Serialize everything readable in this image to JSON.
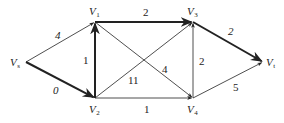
{
  "diagram": {
    "type": "directed-network",
    "nodes": [
      {
        "id": "Vs",
        "label": "V",
        "sub": "s",
        "x": 26,
        "y": 62,
        "lx": 10,
        "ly": 66
      },
      {
        "id": "V1",
        "label": "V",
        "sub": "1",
        "x": 95,
        "y": 22,
        "lx": 89,
        "ly": 15
      },
      {
        "id": "V2",
        "label": "V",
        "sub": "2",
        "x": 95,
        "y": 98,
        "lx": 89,
        "ly": 113
      },
      {
        "id": "V3",
        "label": "V",
        "sub": "3",
        "x": 193,
        "y": 22,
        "lx": 187,
        "ly": 15
      },
      {
        "id": "V4",
        "label": "V",
        "sub": "4",
        "x": 193,
        "y": 98,
        "lx": 187,
        "ly": 113
      },
      {
        "id": "Vt",
        "label": "V",
        "sub": "t",
        "x": 263,
        "y": 62,
        "lx": 266,
        "ly": 66
      }
    ],
    "edges": [
      {
        "from": "Vs",
        "to": "V1",
        "weight": "4",
        "bold": false,
        "lx": 55,
        "ly": 39,
        "italic": true
      },
      {
        "from": "Vs",
        "to": "V2",
        "weight": "0",
        "bold": true,
        "lx": 53,
        "ly": 94,
        "italic": true
      },
      {
        "from": "V2",
        "to": "V1",
        "weight": "1",
        "bold": true,
        "lx": 83,
        "ly": 64,
        "italic": false
      },
      {
        "from": "V1",
        "to": "V3",
        "weight": "2",
        "bold": true,
        "lx": 143,
        "ly": 16,
        "italic": false
      },
      {
        "from": "V2",
        "to": "V3",
        "weight": "11",
        "bold": false,
        "lx": 128,
        "ly": 84,
        "italic": false
      },
      {
        "from": "V1",
        "to": "V4",
        "weight": "4",
        "bold": false,
        "lx": 162,
        "ly": 73,
        "italic": false
      },
      {
        "from": "V2",
        "to": "V4",
        "weight": "1",
        "bold": false,
        "lx": 144,
        "ly": 113,
        "italic": false
      },
      {
        "from": "V4",
        "to": "V3",
        "weight": "2",
        "bold": false,
        "lx": 199,
        "ly": 65,
        "italic": false
      },
      {
        "from": "V3",
        "to": "Vt",
        "weight": "2",
        "bold": true,
        "lx": 228,
        "ly": 35,
        "italic": true
      },
      {
        "from": "V4",
        "to": "Vt",
        "weight": "5",
        "bold": false,
        "lx": 233,
        "ly": 91,
        "italic": false
      }
    ],
    "colors": {
      "line": "#222222",
      "background": "#ffffff"
    }
  }
}
